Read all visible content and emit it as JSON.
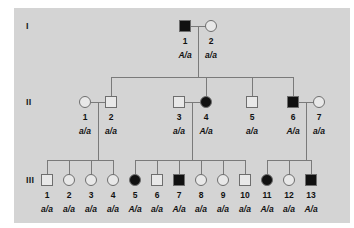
{
  "figure": {
    "type": "pedigree-chart",
    "panel_background": "#d4d4d4",
    "page_background": "#ffffff",
    "line_color": "#7a7a7a",
    "shape_border_color": "#6e6e6e",
    "affected_fill": "#111111",
    "unaffected_fill": "#e8e8e8"
  },
  "generations": [
    {
      "label": "I",
      "y": 26
    },
    {
      "label": "II",
      "y": 102
    },
    {
      "label": "III",
      "y": 180
    }
  ],
  "individuals": [
    {
      "gen": "I",
      "id": "1",
      "sex": "male",
      "affected": true,
      "genotype": "A/a",
      "x": 185,
      "y": 26
    },
    {
      "gen": "I",
      "id": "2",
      "sex": "female",
      "affected": false,
      "genotype": "a/a",
      "x": 211,
      "y": 26
    },
    {
      "gen": "II",
      "id": "1",
      "sex": "female",
      "affected": false,
      "genotype": "a/a",
      "x": 85,
      "y": 102
    },
    {
      "gen": "II",
      "id": "2",
      "sex": "male",
      "affected": false,
      "genotype": "a/a",
      "x": 111,
      "y": 102
    },
    {
      "gen": "II",
      "id": "3",
      "sex": "male",
      "affected": false,
      "genotype": "a/a",
      "x": 179,
      "y": 102
    },
    {
      "gen": "II",
      "id": "4",
      "sex": "female",
      "affected": true,
      "genotype": "A/a",
      "x": 206,
      "y": 102
    },
    {
      "gen": "II",
      "id": "5",
      "sex": "male",
      "affected": false,
      "genotype": "a/a",
      "x": 252,
      "y": 102
    },
    {
      "gen": "II",
      "id": "6",
      "sex": "male",
      "affected": true,
      "genotype": "A/a",
      "x": 293,
      "y": 102
    },
    {
      "gen": "II",
      "id": "7",
      "sex": "female",
      "affected": false,
      "genotype": "a/a",
      "x": 319,
      "y": 102
    },
    {
      "gen": "III",
      "id": "1",
      "sex": "male",
      "affected": false,
      "genotype": "a/a",
      "x": 47,
      "y": 180
    },
    {
      "gen": "III",
      "id": "2",
      "sex": "female",
      "affected": false,
      "genotype": "a/a",
      "x": 69,
      "y": 180
    },
    {
      "gen": "III",
      "id": "3",
      "sex": "female",
      "affected": false,
      "genotype": "a/a",
      "x": 91,
      "y": 180
    },
    {
      "gen": "III",
      "id": "4",
      "sex": "female",
      "affected": false,
      "genotype": "a/a",
      "x": 113,
      "y": 180
    },
    {
      "gen": "III",
      "id": "5",
      "sex": "female",
      "affected": true,
      "genotype": "A/a",
      "x": 135,
      "y": 180
    },
    {
      "gen": "III",
      "id": "6",
      "sex": "male",
      "affected": false,
      "genotype": "a/a",
      "x": 157,
      "y": 180
    },
    {
      "gen": "III",
      "id": "7",
      "sex": "male",
      "affected": true,
      "genotype": "A/a",
      "x": 179,
      "y": 180
    },
    {
      "gen": "III",
      "id": "8",
      "sex": "female",
      "affected": false,
      "genotype": "a/a",
      "x": 201,
      "y": 180
    },
    {
      "gen": "III",
      "id": "9",
      "sex": "female",
      "affected": false,
      "genotype": "a/a",
      "x": 223,
      "y": 180
    },
    {
      "gen": "III",
      "id": "10",
      "sex": "male",
      "affected": false,
      "genotype": "a/a",
      "x": 245,
      "y": 180
    },
    {
      "gen": "III",
      "id": "11",
      "sex": "female",
      "affected": true,
      "genotype": "A/a",
      "x": 267,
      "y": 180
    },
    {
      "gen": "III",
      "id": "12",
      "sex": "female",
      "affected": false,
      "genotype": "a/a",
      "x": 289,
      "y": 180
    },
    {
      "gen": "III",
      "id": "13",
      "sex": "male",
      "affected": true,
      "genotype": "A/a",
      "x": 311,
      "y": 180
    }
  ],
  "matings": [
    {
      "name": "mating-I-1-x-I-2",
      "left_x": 185,
      "right_x": 211,
      "y": 26,
      "drop_x": 198
    },
    {
      "name": "mating-II-1-x-II-2",
      "left_x": 85,
      "right_x": 111,
      "y": 102,
      "drop_x": 98
    },
    {
      "name": "mating-II-3-x-II-4",
      "left_x": 179,
      "right_x": 206,
      "y": 102,
      "drop_x": 192
    },
    {
      "name": "mating-II-6-x-II-7",
      "left_x": 293,
      "right_x": 319,
      "y": 102,
      "drop_x": 306
    }
  ],
  "sibships": [
    {
      "name": "sibship-generation-II",
      "parent_drop_x": 198,
      "parent_y": 26,
      "bar_y": 77,
      "child_y": 102,
      "children_x": [
        111,
        206,
        252,
        293
      ]
    },
    {
      "name": "sibship-III-family-1",
      "parent_drop_x": 98,
      "parent_y": 102,
      "bar_y": 160,
      "child_y": 180,
      "children_x": [
        47,
        69,
        91,
        113
      ]
    },
    {
      "name": "sibship-III-family-2",
      "parent_drop_x": 192,
      "parent_y": 102,
      "bar_y": 160,
      "child_y": 180,
      "children_x": [
        135,
        157,
        179,
        201,
        223,
        245
      ]
    },
    {
      "name": "sibship-III-family-3",
      "parent_drop_x": 306,
      "parent_y": 102,
      "bar_y": 160,
      "child_y": 180,
      "children_x": [
        267,
        289,
        311
      ]
    }
  ],
  "gen_label_x": 26,
  "shape_size": 11,
  "id_offset_y": 10,
  "geno_offset_y": 24
}
